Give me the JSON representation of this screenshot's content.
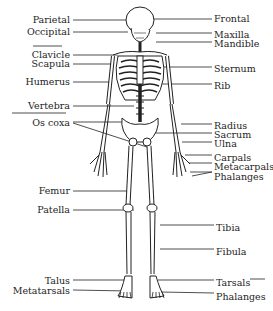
{
  "diagram": {
    "left_labels": [
      {
        "id": "parietal",
        "text": "Parietal",
        "x": 70,
        "y": 15
      },
      {
        "id": "occipital",
        "text": "Occipital",
        "x": 70,
        "y": 27
      },
      {
        "id": "clavicle",
        "text": "Clavicle",
        "x": 70,
        "y": 50
      },
      {
        "id": "scapula",
        "text": "Scapula",
        "x": 70,
        "y": 59
      },
      {
        "id": "humerus",
        "text": "Humerus",
        "x": 70,
        "y": 77
      },
      {
        "id": "vertebra",
        "text": "Vertebra",
        "x": 70,
        "y": 101
      },
      {
        "id": "os-coxa",
        "text": "Os coxa",
        "x": 70,
        "y": 118
      },
      {
        "id": "femur",
        "text": "Femur",
        "x": 70,
        "y": 186
      },
      {
        "id": "patella",
        "text": "Patella",
        "x": 70,
        "y": 205
      },
      {
        "id": "talus",
        "text": "Talus",
        "x": 70,
        "y": 276
      },
      {
        "id": "metatarsals",
        "text": "Metatarsals",
        "x": 70,
        "y": 286
      }
    ],
    "right_labels": [
      {
        "id": "frontal",
        "text": "Frontal",
        "x": 214,
        "y": 14
      },
      {
        "id": "maxilla",
        "text": "Maxilla",
        "x": 214,
        "y": 30
      },
      {
        "id": "mandible",
        "text": "Mandible",
        "x": 214,
        "y": 39
      },
      {
        "id": "sternum",
        "text": "Sternum",
        "x": 214,
        "y": 64
      },
      {
        "id": "rib",
        "text": "Rib",
        "x": 214,
        "y": 81
      },
      {
        "id": "radius",
        "text": "Radius",
        "x": 214,
        "y": 121
      },
      {
        "id": "sacrum",
        "text": "Sacrum",
        "x": 214,
        "y": 130
      },
      {
        "id": "ulna",
        "text": "Ulna",
        "x": 214,
        "y": 139
      },
      {
        "id": "carpals",
        "text": "Carpals",
        "x": 214,
        "y": 153
      },
      {
        "id": "metacarpals",
        "text": "Metacarpals",
        "x": 214,
        "y": 162
      },
      {
        "id": "phalanges-hand",
        "text": "Phalanges",
        "x": 214,
        "y": 172
      },
      {
        "id": "tibia",
        "text": "Tibia",
        "x": 216,
        "y": 223
      },
      {
        "id": "fibula",
        "text": "Fibula",
        "x": 216,
        "y": 247
      },
      {
        "id": "tarsals",
        "text": "Tarsals",
        "x": 216,
        "y": 278
      },
      {
        "id": "phalanges-foot",
        "text": "Phalanges",
        "x": 216,
        "y": 292
      }
    ]
  }
}
